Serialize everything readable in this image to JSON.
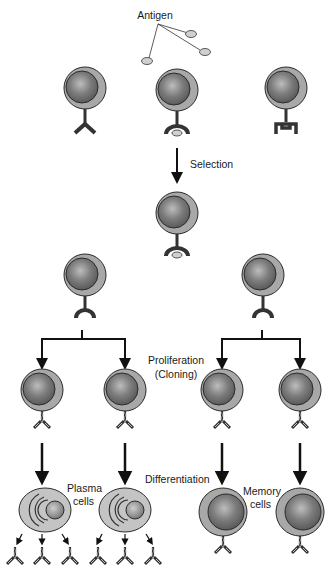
{
  "diagram": {
    "labels": {
      "antigen": "Antigen",
      "selection": "Selection",
      "proliferation_line1": "Proliferation",
      "proliferation_line2": "(Cloning)",
      "differentiation": "Differentiation",
      "plasma_line1": "Plasma",
      "plasma_line2": "cells",
      "memory_line1": "Memory",
      "memory_line2": "cells"
    },
    "colors": {
      "cell_outer": "#a8a8a8",
      "cell_nucleus": "#7a7a7a",
      "outline": "#2b2b2b",
      "antigen": "#d0d0d0",
      "receptor": "#333333",
      "plasma_cell": "#c4c4c4",
      "background": "#ffffff"
    },
    "stages": [
      {
        "name": "naive-b-cells",
        "count": 3,
        "receptors": [
          "y-shape",
          "cup-shape-bound",
          "square-shape"
        ]
      },
      {
        "name": "selected-cell",
        "count": 1
      },
      {
        "name": "activated-cells",
        "count": 2
      },
      {
        "name": "cloned-cells",
        "count": 4
      },
      {
        "name": "plasma-cells",
        "count": 2,
        "antibodies_each": 3
      },
      {
        "name": "memory-cells",
        "count": 2
      }
    ]
  }
}
